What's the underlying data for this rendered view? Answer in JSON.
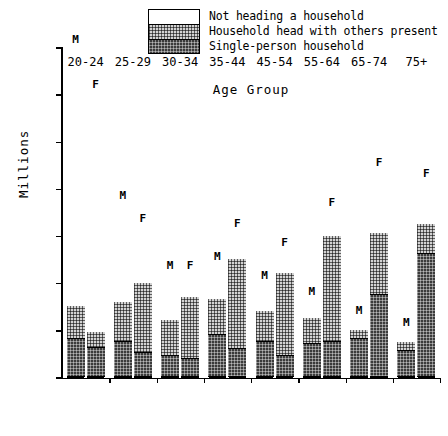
{
  "chart_data": {
    "type": "bar",
    "subtype": "stacked-grouped",
    "title": "",
    "xlabel": "Age Group",
    "ylabel": "Millions",
    "ylim": [
      0,
      7
    ],
    "yticks": [
      0,
      1,
      2,
      3,
      4,
      5,
      6,
      7
    ],
    "ytick_labels": [
      "0",
      "1",
      "2",
      "3",
      "4",
      "5",
      "6",
      "7"
    ],
    "grid": false,
    "legend_position": "top-center",
    "categories": [
      "20-24",
      "25-29",
      "30-34",
      "35-44",
      "45-54",
      "55-64",
      "65-74",
      "75+"
    ],
    "group_labels": [
      "M",
      "F"
    ],
    "stack_order_bottom_to_top": [
      "Single-person household",
      "Household head with others present",
      "Not heading a household"
    ],
    "legend": [
      {
        "label": "Not heading a household",
        "fill": "white"
      },
      {
        "label": "Household head with others present",
        "fill": "stipple"
      },
      {
        "label": "Single-person household",
        "fill": "dark"
      }
    ],
    "series": [
      {
        "name": "Single-person household",
        "fill": "dark",
        "values_male": [
          0.8,
          0.75,
          0.45,
          0.9,
          0.75,
          0.7,
          0.8,
          0.55
        ],
        "values_female": [
          0.62,
          0.52,
          0.38,
          0.6,
          0.45,
          0.75,
          1.75,
          2.6
        ]
      },
      {
        "name": "Household head with others present",
        "fill": "stipple",
        "values_male": [
          0.7,
          0.85,
          0.75,
          0.75,
          0.65,
          0.55,
          0.2,
          0.2
        ],
        "values_female": [
          0.33,
          1.48,
          1.32,
          1.9,
          1.75,
          2.25,
          1.3,
          0.65
        ]
      },
      {
        "name": "Not heading a household",
        "fill": "white",
        "values_male": [
          5.5,
          2.1,
          1.0,
          0.75,
          0.6,
          0.4,
          0.25,
          0.25
        ],
        "values_female": [
          5.1,
          1.2,
          0.5,
          0.6,
          0.5,
          0.55,
          1.35,
          0.9
        ]
      }
    ],
    "totals_male": [
      7.0,
      3.7,
      2.2,
      2.4,
      2.0,
      1.65,
      1.25,
      1.0
    ],
    "totals_female": [
      6.05,
      3.2,
      2.2,
      3.1,
      2.7,
      3.55,
      4.4,
      4.15
    ]
  },
  "colors": {
    "axis": "#000000",
    "white_fill": "#ffffff",
    "stipple_fill": "#d3d3d3",
    "dark_fill": "#3b3b3b"
  }
}
